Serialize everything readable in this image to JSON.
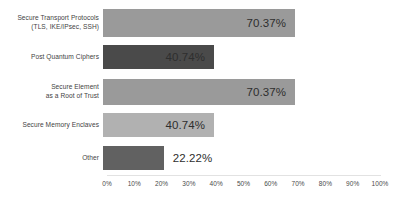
{
  "chart_data": {
    "type": "bar",
    "orientation": "horizontal",
    "title": "",
    "subtitle": "",
    "xlabel": "",
    "ylabel": "",
    "xlim": [
      0,
      100
    ],
    "grid": false,
    "legend": false,
    "legend_position": "none",
    "categories": [
      "Secure Transport Protocols\n(TLS, IKE/IPsec, SSH)",
      "Post Quantum Ciphers",
      "Secure Element\nas a Root of Trust",
      "Secure Memory Enclaves",
      "Other"
    ],
    "values": [
      70.37,
      40.74,
      70.37,
      40.74,
      22.22
    ],
    "value_labels": [
      "70.37%",
      "40.74%",
      "70.37%",
      "40.74%",
      "22.22%"
    ],
    "label_placement": [
      "inside",
      "inside",
      "inside",
      "inside",
      "outside"
    ],
    "bar_colors": [
      "#9a9a9a",
      "#4a4a4a",
      "#9a9a9a",
      "#b1b1b1",
      "#616161"
    ],
    "tick_labels": [
      "0%",
      "10%",
      "20%",
      "30%",
      "40%",
      "50%",
      "60%",
      "70%",
      "80%",
      "90%",
      "100%"
    ],
    "tick_values": [
      0,
      10,
      20,
      30,
      40,
      50,
      60,
      70,
      80,
      90,
      100
    ],
    "axis_color": "#e2e2e2",
    "background_color": "#ffffff",
    "text_color": "#3a3a3a"
  }
}
